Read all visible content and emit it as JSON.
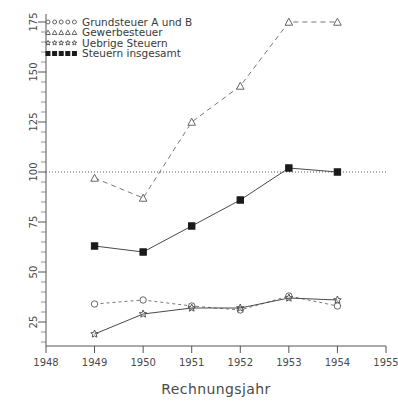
{
  "chart_data": {
    "type": "line",
    "title": "",
    "xlabel": "Rechnungsjahr",
    "ylabel": "",
    "xlim": [
      1948,
      1955
    ],
    "ylim": [
      0,
      180
    ],
    "xticks": [
      "1948",
      "1949",
      "1950",
      "1951",
      "1952",
      "1953",
      "1954",
      "1955"
    ],
    "yticks": [
      "25",
      "50",
      "75",
      "100",
      "125",
      "150",
      "175"
    ],
    "grid": false,
    "reference_line": 100,
    "legend_position": "top-left",
    "x": [
      1949,
      1950,
      1951,
      1952,
      1953,
      1954
    ],
    "series": [
      {
        "name": "Grundsteuer A und B",
        "marker": "circle-open",
        "linestyle": "dotted",
        "values": [
          34,
          36,
          33,
          31,
          38,
          33
        ]
      },
      {
        "name": "Gewerbesteuer",
        "marker": "triangle-open",
        "linestyle": "dashed",
        "values": [
          97,
          87,
          125,
          143,
          175,
          175
        ]
      },
      {
        "name": "Uebrige Steuern",
        "marker": "star",
        "linestyle": "solid",
        "values": [
          19,
          29,
          32,
          32,
          37,
          36
        ]
      },
      {
        "name": "Steuern insgesamt",
        "marker": "square-filled",
        "linestyle": "solid",
        "values": [
          63,
          60,
          73,
          86,
          102,
          100
        ]
      }
    ]
  },
  "legend": {
    "items": [
      {
        "label": "Grundsteuer A und B",
        "marker": "circle-open"
      },
      {
        "label": "Gewerbesteuer",
        "marker": "triangle-open"
      },
      {
        "label": "Uebrige Steuern",
        "marker": "star"
      },
      {
        "label": "Steuern insgesamt",
        "marker": "square-filled"
      }
    ]
  },
  "axes": {
    "x_title": "Rechnungsjahr"
  }
}
